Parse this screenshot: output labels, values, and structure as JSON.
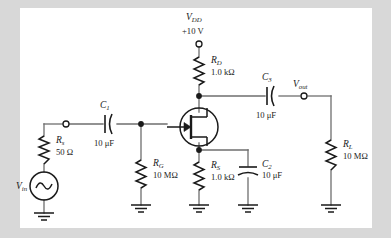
{
  "figure": {
    "type": "jfet-common-source-amplifier-schematic",
    "background": "#ffffff",
    "page_background": "#d8d8d8"
  },
  "supply": {
    "name_main": "V",
    "name_sub": "DD",
    "voltage": "+10 V",
    "terminal": "open-circle"
  },
  "components": {
    "rd": {
      "name_main": "R",
      "name_sub": "D",
      "value": "1.0 kΩ"
    },
    "rg": {
      "name_main": "R",
      "name_sub": "G",
      "value": "10 MΩ"
    },
    "rs_source_resistor": {
      "name_main": "R",
      "name_sub": "S",
      "value": "1.0 kΩ"
    },
    "rs_series": {
      "name_main": "R",
      "name_sub": "s",
      "value": "50 Ω"
    },
    "rl": {
      "name_main": "R",
      "name_sub": "L",
      "value": "10 MΩ"
    },
    "c1": {
      "name_main": "C",
      "name_sub": "1",
      "value": "10 μF",
      "style": "non-polarized"
    },
    "c2": {
      "name_main": "C",
      "name_sub": "2",
      "value": "10 μF",
      "style": "polarized"
    },
    "c3": {
      "name_main": "C",
      "name_sub": "3",
      "value": "10 μF",
      "style": "non-polarized"
    },
    "transistor": {
      "type": "n-channel-jfet",
      "label": ""
    }
  },
  "nodes": {
    "vin": {
      "name_main": "V",
      "name_sub": "in",
      "terminal": "open-circle"
    },
    "vout": {
      "name_main": "V",
      "name_sub": "out",
      "terminal": "open-circle"
    }
  },
  "source": {
    "type": "ac-sine-source"
  },
  "grounds": {
    "count": 5,
    "symbol": "earth-ground"
  },
  "colors": {
    "wire": "#6e6e6e",
    "component": "#1a1a1a",
    "text": "#1a1a1a",
    "figure_bg": "#ffffff",
    "page_bg": "#d8d8d8"
  }
}
